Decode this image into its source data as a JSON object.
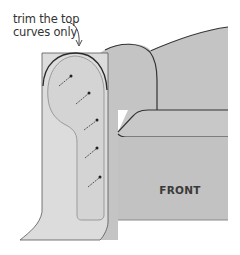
{
  "callout": {
    "line1": "trim the top",
    "line2": "curves only"
  },
  "sofa": {
    "front_label": "FRONT"
  },
  "colors": {
    "sofa_fill": "#c4c4c4",
    "fabric_fill": "#dcdcdc",
    "outline": "#333333",
    "stitch_line": "#9a9a9a",
    "background": "#ffffff"
  },
  "pins": {
    "count": 6
  }
}
